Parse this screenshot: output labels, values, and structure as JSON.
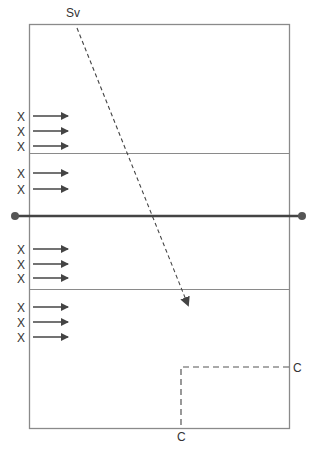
{
  "diagram": {
    "server_label": "Sv",
    "corner_labels": [
      "C",
      "C"
    ],
    "player_marker": "X",
    "top_back_row": [
      "X",
      "X",
      "X"
    ],
    "top_front_row": [
      "X",
      "X"
    ],
    "bottom_front_row": [
      "X",
      "X",
      "X"
    ],
    "bottom_back_row": [
      "X",
      "X",
      "X"
    ],
    "colors": {
      "court_line": "#888888",
      "net": "#444444",
      "arrow": "#444444",
      "text": "#333333"
    }
  }
}
